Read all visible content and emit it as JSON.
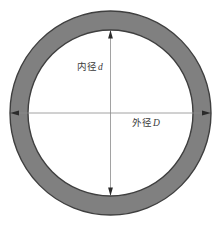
{
  "figure": {
    "title": "",
    "type": "annulus-cross-section-diagram",
    "background_color": "#ffffff",
    "width": 220,
    "height": 226
  },
  "shape": {
    "name": "annulus",
    "ring_fill_color": "#808080",
    "ring_stroke_color": "#3f3f3f",
    "inner_fill_color": "#ffffff",
    "center_x": 110.5,
    "center_y": 113,
    "outer_radius_x": 100.5,
    "outer_radius_y": 102,
    "inner_radius_x": 82.5,
    "inner_radius_y": 83,
    "band_thickness": 18
  },
  "dimensions": {
    "inner": {
      "label_cn": "内径",
      "symbol": "d",
      "full_text": "内径d",
      "meaning": "inner diameter",
      "orientation": "vertical",
      "line_color": "#7a7a7a",
      "arrow_from_y": 30,
      "arrow_to_y": 196,
      "arrow_x": 110.5
    },
    "outer": {
      "label_cn": "外径",
      "symbol": "D",
      "full_text": "外径D",
      "meaning": "outer diameter",
      "orientation": "horizontal",
      "line_color": "#7a7a7a",
      "arrow_from_x": 10,
      "arrow_to_x": 211,
      "arrow_y": 113
    }
  }
}
